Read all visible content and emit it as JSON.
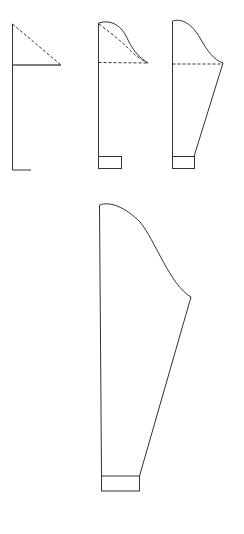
{
  "diagram": {
    "type": "sleeve-pattern-drafting-steps",
    "stroke_color": "#333333",
    "background": "#ffffff",
    "steps": [
      {
        "id": 1,
        "label": "base-lines"
      },
      {
        "id": 2,
        "label": "sleeve-cap-curve"
      },
      {
        "id": 3,
        "label": "sleeve-outline"
      },
      {
        "id": 4,
        "label": "final-sleeve"
      }
    ]
  }
}
